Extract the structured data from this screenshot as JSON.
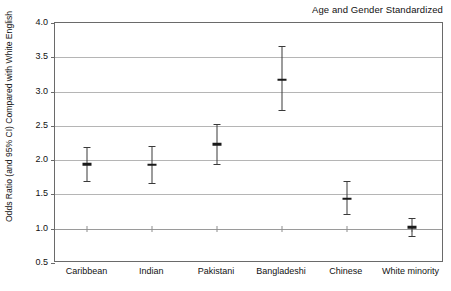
{
  "chart_data": {
    "type": "scatter",
    "title": "Age and Gender Standardized",
    "xlabel": "",
    "ylabel": "Odds Ratio (and 95% CI) Compared with White English",
    "ylim": [
      0.5,
      4.0
    ],
    "yticks": [
      "0.5",
      "1.0",
      "1.5",
      "2.0",
      "2.5",
      "3.0",
      "3.5",
      "4.0"
    ],
    "ytick_values": [
      0.5,
      1.0,
      1.5,
      2.0,
      2.5,
      3.0,
      3.5,
      4.0
    ],
    "grid": true,
    "legend": "none",
    "reference_line": 1.0,
    "categories": [
      "Caribbean",
      "Indian",
      "Pakistani",
      "Bangladeshi",
      "Chinese",
      "White minority"
    ],
    "series": [
      {
        "name": "Odds Ratio (95% CI)",
        "values": [
          1.94,
          1.93,
          2.23,
          3.17,
          1.44,
          1.02
        ],
        "ci_lower": [
          1.7,
          1.67,
          1.95,
          2.73,
          1.21,
          0.89
        ],
        "ci_upper": [
          2.19,
          2.2,
          2.53,
          3.67,
          1.7,
          1.15
        ]
      }
    ],
    "points": [
      {
        "category": "Caribbean",
        "value": 1.94,
        "ci_lower": 1.7,
        "ci_upper": 2.19
      },
      {
        "category": "Indian",
        "value": 1.93,
        "ci_lower": 1.67,
        "ci_upper": 2.2
      },
      {
        "category": "Pakistani",
        "value": 2.23,
        "ci_lower": 1.95,
        "ci_upper": 2.53
      },
      {
        "category": "Bangladeshi",
        "value": 3.17,
        "ci_lower": 2.73,
        "ci_upper": 3.67
      },
      {
        "category": "Chinese",
        "value": 1.44,
        "ci_lower": 1.21,
        "ci_upper": 1.7
      },
      {
        "category": "White minority",
        "value": 1.02,
        "ci_lower": 0.89,
        "ci_upper": 1.15
      }
    ],
    "colors": {
      "marker": "#1a1a1a",
      "errorbar": "#3a3a3a",
      "gridline": "#b5b5b5",
      "axis": "#6a6a6a",
      "text": "#111111",
      "background": "#ffffff"
    }
  }
}
